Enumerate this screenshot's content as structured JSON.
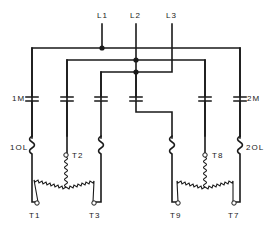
{
  "diagram": {
    "type": "wiring-schematic",
    "lines": [
      {
        "id": "L1",
        "label": "L1"
      },
      {
        "id": "L2",
        "label": "L2"
      },
      {
        "id": "L3",
        "label": "L3"
      }
    ],
    "contactors": [
      {
        "id": "1M",
        "label": "1M"
      },
      {
        "id": "2M",
        "label": "2M"
      }
    ],
    "overloads": [
      {
        "id": "1OL",
        "label": "1OL"
      },
      {
        "id": "2OL",
        "label": "2OL"
      }
    ],
    "terminals": [
      {
        "id": "T1",
        "label": "T1"
      },
      {
        "id": "T2",
        "label": "T2"
      },
      {
        "id": "T3",
        "label": "T3"
      },
      {
        "id": "T7",
        "label": "T7"
      },
      {
        "id": "T8",
        "label": "T8"
      },
      {
        "id": "T9",
        "label": "T9"
      }
    ],
    "windings": [
      {
        "id": "winding-1",
        "terminals": [
          "T1",
          "T2",
          "T3"
        ],
        "connection": "wye"
      },
      {
        "id": "winding-2",
        "terminals": [
          "T7",
          "T8",
          "T9"
        ],
        "connection": "wye"
      }
    ],
    "colors": {
      "ink": "#1a1a1a",
      "background": "#ffffff"
    }
  }
}
